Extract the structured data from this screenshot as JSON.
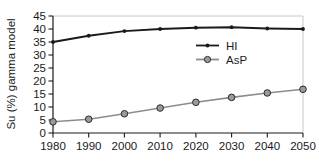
{
  "chart_data": {
    "type": "line",
    "title": "",
    "xlabel": "",
    "ylabel": "Su (%) gamma model",
    "x": [
      1980,
      1990,
      2000,
      2010,
      2020,
      2030,
      2040,
      2050
    ],
    "xtick_labels": [
      "1980",
      "1990",
      "2000",
      "2010",
      "2020",
      "2030",
      "2040",
      "2050"
    ],
    "xlim": [
      1980,
      2050
    ],
    "ylim": [
      0,
      45
    ],
    "ytick_labels": [
      "0",
      "5",
      "10",
      "15",
      "20",
      "25",
      "30",
      "35",
      "40",
      "45"
    ],
    "yticks": [
      0,
      5,
      10,
      15,
      20,
      25,
      30,
      35,
      40,
      45
    ],
    "grid": false,
    "legend_position": "center-right",
    "series": [
      {
        "name": "HI",
        "color": "#1a1a1a",
        "marker": "dot",
        "values": [
          35.0,
          37.4,
          39.2,
          40.0,
          40.5,
          40.7,
          40.2,
          40.0
        ]
      },
      {
        "name": "AsP",
        "color": "#8c8c8c",
        "marker": "circle",
        "values": [
          4.3,
          5.3,
          7.4,
          9.6,
          11.8,
          13.7,
          15.4,
          16.8
        ]
      }
    ]
  },
  "legend": {
    "entries": [
      {
        "label": "HI"
      },
      {
        "label": "AsP"
      }
    ]
  },
  "axes": {
    "y_title": "Su (%) gamma model"
  }
}
